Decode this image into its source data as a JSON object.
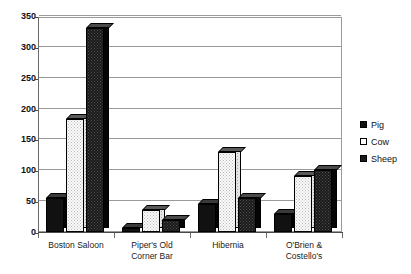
{
  "chart_data": {
    "type": "bar",
    "title": "",
    "subtitle": "",
    "xlabel": "",
    "ylabel": "",
    "ylim": [
      0,
      350
    ],
    "yticks": [
      0,
      50,
      100,
      150,
      200,
      250,
      300,
      350
    ],
    "grid": true,
    "legend_position": "right",
    "style": "3d-clustered-column",
    "categories": [
      "Boston Saloon",
      "Piper's Old Corner Bar",
      "Hibernia",
      "O'Brien & Costello's"
    ],
    "category_lines": [
      [
        "Boston Saloon"
      ],
      [
        "Piper's Old",
        "Corner Bar"
      ],
      [
        "Hibernia"
      ],
      [
        "O'Brien &",
        "Costello's"
      ]
    ],
    "series": [
      {
        "name": "Pig",
        "values": [
          55,
          7,
          45,
          30
        ]
      },
      {
        "name": "Cow",
        "values": [
          183,
          35,
          130,
          90
        ]
      },
      {
        "name": "Sheep",
        "values": [
          330,
          20,
          55,
          100
        ]
      }
    ]
  },
  "legend": {
    "items": [
      {
        "label": "Pig",
        "swatch": "filled-black-square"
      },
      {
        "label": "Cow",
        "swatch": "empty-white-square"
      },
      {
        "label": "Sheep",
        "swatch": "filled-black-square"
      }
    ]
  },
  "axis": {
    "y_tick_labels": [
      "350",
      "300",
      "250",
      "200",
      "150",
      "100",
      "50",
      "0"
    ]
  }
}
